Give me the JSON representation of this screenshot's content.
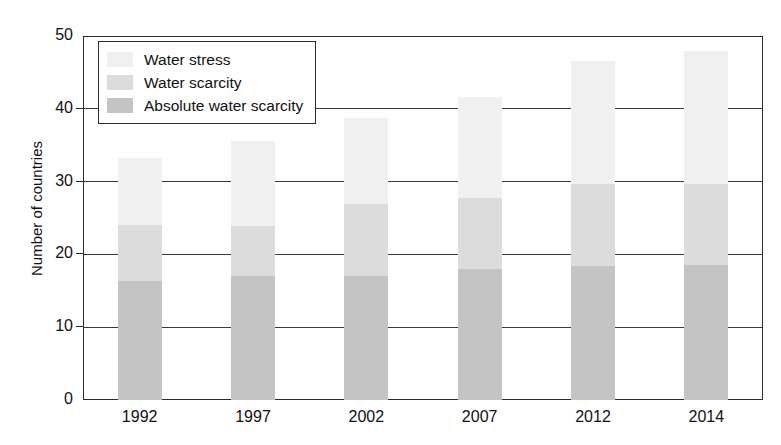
{
  "chart_data": {
    "type": "bar",
    "subtype": "stacked-vertical",
    "title": "",
    "xlabel": "",
    "ylabel": "Number of countries",
    "categories": [
      "1992",
      "1997",
      "2002",
      "2007",
      "2012",
      "2014"
    ],
    "ylim": [
      0,
      50
    ],
    "yticks": [
      0,
      10,
      20,
      30,
      40,
      50
    ],
    "ytick_labels": [
      "0",
      "10",
      "20",
      "30",
      "40",
      "50"
    ],
    "grid": "horizontal",
    "legend_position": "top-left-inside",
    "series": [
      {
        "name": "Absolute water scarcity",
        "color": "#c4c4c4",
        "values": [
          16.3,
          17.1,
          17.1,
          18.0,
          18.4,
          18.5
        ]
      },
      {
        "name": "Water scarcity",
        "color": "#dcdcdc",
        "values": [
          7.7,
          6.8,
          9.8,
          9.7,
          11.3,
          11.2
        ]
      },
      {
        "name": "Water stress",
        "color": "#f0f0f0",
        "values": [
          9.3,
          11.7,
          11.8,
          13.9,
          16.9,
          18.3
        ]
      }
    ],
    "totals": [
      33.3,
      35.6,
      38.7,
      41.6,
      46.6,
      48.0
    ]
  },
  "legend": {
    "items": [
      {
        "label": "Water stress",
        "swatch": "#f0f0f0"
      },
      {
        "label": "Water scarcity",
        "swatch": "#dcdcdc"
      },
      {
        "label": "Absolute water scarcity",
        "swatch": "#c4c4c4"
      }
    ]
  },
  "axis": {
    "y_title": "Number of countries"
  },
  "colors": {
    "axis": "#2b2b2b",
    "grid": "#3a3a3a",
    "text": "#111111",
    "background": "#ffffff"
  }
}
